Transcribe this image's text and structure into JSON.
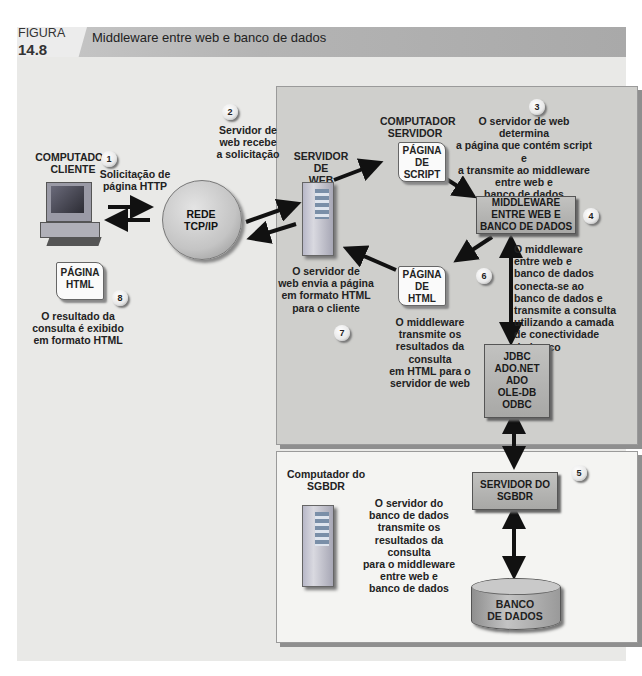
{
  "figure": {
    "label": "FIGURA",
    "number": "14.8",
    "title": "Middleware entre web e banco de dados"
  },
  "client": {
    "title": "COMPUTADOR\nCLIENTE",
    "request_label": "Solicitação de\npágina HTTP",
    "html_page": "PÁGINA\nHTML",
    "result_text": "O resultado da\nconsulta é exibido\nem formato HTML"
  },
  "network": {
    "label": "REDE\nTCP/IP",
    "receive_text": "Servidor de\nweb recebe\na solicitação"
  },
  "web_server": {
    "title": "SERVIDOR DE\nWEB",
    "send_text": "O servidor de\nweb envia a página\nem formato HTML\npara o cliente"
  },
  "server_computer": {
    "title": "COMPUTADOR\nSERVIDOR",
    "script_page": "PÁGINA\nDE\nSCRIPT",
    "script_text": "O servidor de web determina\na página que contém script e\na transmite ao middleware\nentre web e\nbanco de dados",
    "middleware": "MIDDLEWARE\nENTRE WEB E\nBANCO DE DADOS",
    "middleware_text": "O middleware\nentre web e\nbanco de dados\nconecta-se ao\nbanco de dados e\ntransmite a consulta\nutilizando a camada\nde conectividade\ndo banco",
    "html_page": "PÁGINA\nDE\nHTML",
    "html_text": "O middleware\ntransmite os\nresultados da consulta\nem HTML para o\nservidor de web",
    "connectivity": "JDBC\nADO.NET\nADO\nOLE-DB\nODBC"
  },
  "dbms": {
    "title": "Computador do\nSGBDR",
    "server_box": "SERVIDOR DO\nSGBDR",
    "server_text": "O servidor do\nbanco de dados\ntransmite os\nresultados da consulta\npara o middleware\nentre web e\nbanco de dados",
    "database": "BANCO\nDE DADOS"
  },
  "steps": [
    "1",
    "2",
    "3",
    "4",
    "5",
    "6",
    "7",
    "8"
  ],
  "colors": {
    "header": "#b4b4b4",
    "canvas": "#e9e9e7",
    "web_box": "#cfcfcc",
    "db_box": "#f4f4f2",
    "component": "#b0b0ae"
  }
}
